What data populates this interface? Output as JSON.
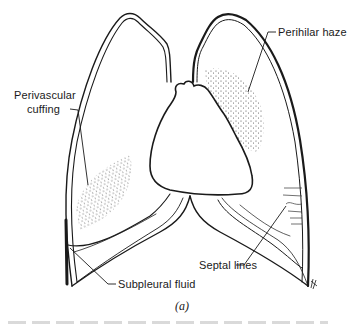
{
  "figure": {
    "panel_label": "(a)",
    "labels": {
      "perihilar_haze": "Perihilar haze",
      "perivascular_line1": "Perivascular",
      "perivascular_line2": "cuffing",
      "septal_lines": "Septal lines",
      "subpleural_fluid": "Subpleural fluid"
    },
    "colors": {
      "ink": "#1a1a1a",
      "background": "#ffffff"
    }
  }
}
